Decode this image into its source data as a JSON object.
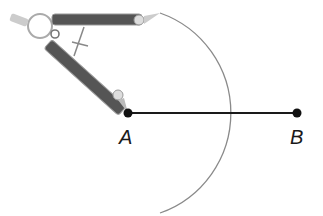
{
  "figure": {
    "points": [
      {
        "id": "A",
        "label": "A",
        "x": 128,
        "y": 113
      },
      {
        "id": "B",
        "label": "B",
        "x": 297,
        "y": 113
      }
    ],
    "segment": {
      "from": "A",
      "to": "B"
    },
    "arc": {
      "center": "A",
      "radius": 106,
      "start": [
        160,
        13
      ],
      "end": [
        160,
        213
      ]
    },
    "colors": {
      "segment": "#1a1a1a",
      "arc": "#8a8a8a",
      "compass_leg": "#5a5a5a",
      "compass_outline": "#9a9a9a"
    }
  }
}
